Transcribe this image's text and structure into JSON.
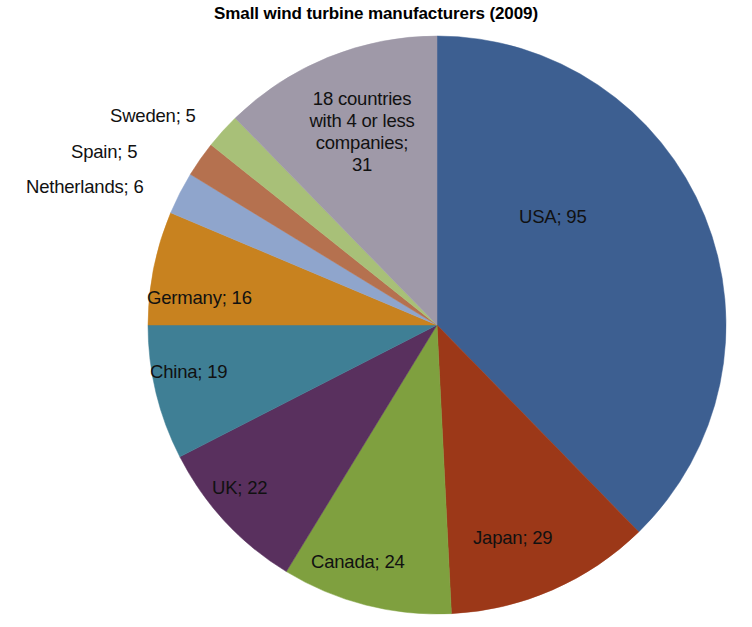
{
  "chart_data": {
    "type": "pie",
    "title": "Small wind turbine manufacturers (2009)",
    "xlabel": "",
    "ylabel": "",
    "legend_position": "none",
    "grid": false,
    "label_format": "name; value",
    "total": 232,
    "start_angle_deg": 0,
    "direction": "clockwise",
    "categories": [
      "USA",
      "Japan",
      "Canada",
      "UK",
      "China",
      "Germany",
      "Netherlands",
      "Spain",
      "Sweden",
      "18 countries with 4 or less companies"
    ],
    "values": [
      95,
      29,
      24,
      22,
      19,
      16,
      6,
      5,
      5,
      31
    ],
    "colors": [
      "#3d5f91",
      "#9c3818",
      "#7fa03f",
      "#59305e",
      "#3f7f95",
      "#c8821f",
      "#8fa5cc",
      "#b5714f",
      "#a8c078",
      "#9f99a8"
    ],
    "slices": [
      {
        "name": "USA",
        "value": 95,
        "label": "USA; 95",
        "color": "#3d5f91"
      },
      {
        "name": "Japan",
        "value": 29,
        "label": "Japan; 29",
        "color": "#9c3818"
      },
      {
        "name": "Canada",
        "value": 24,
        "label": "Canada; 24",
        "color": "#7fa03f"
      },
      {
        "name": "UK",
        "value": 22,
        "label": "UK; 22",
        "color": "#59305e"
      },
      {
        "name": "China",
        "value": 19,
        "label": "China; 19",
        "color": "#3f7f95"
      },
      {
        "name": "Germany",
        "value": 16,
        "label": "Germany; 16",
        "color": "#c8821f"
      },
      {
        "name": "Netherlands",
        "value": 6,
        "label": "Netherlands; 6",
        "color": "#8fa5cc"
      },
      {
        "name": "Spain",
        "value": 5,
        "label": "Spain; 5",
        "color": "#b5714f"
      },
      {
        "name": "Sweden",
        "value": 5,
        "label": "Sweden; 5",
        "color": "#a8c078"
      },
      {
        "name": "18 countries with 4 or less companies",
        "value": 31,
        "label": "18 countries with 4 or less companies; 31",
        "color": "#9f99a8"
      }
    ]
  },
  "labels": {
    "usa": "USA; 95",
    "japan": "Japan; 29",
    "canada": "Canada; 24",
    "uk": "UK; 22",
    "china": "China; 19",
    "germany": "Germany; 16",
    "netherlands": "Netherlands; 6",
    "spain": "Spain; 5",
    "sweden": "Sweden; 5",
    "other_line1": "18 countries",
    "other_line2": "with 4 or less",
    "other_line3": "companies;",
    "other_line4": "31"
  },
  "geometry": {
    "center_x": 437,
    "center_y": 325,
    "radius": 289
  }
}
